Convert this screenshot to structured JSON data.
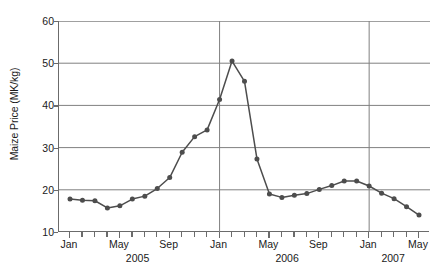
{
  "chart_data": {
    "type": "line",
    "title": "",
    "xlabel": "",
    "ylabel": "Maize Price (MK/kg)",
    "ylim": [
      10,
      60
    ],
    "y_ticks": [
      10,
      20,
      30,
      40,
      50,
      60
    ],
    "grid": true,
    "legend": null,
    "x_month_labels": [
      {
        "label": "Jan",
        "index": 0
      },
      {
        "label": "May",
        "index": 4
      },
      {
        "label": "Sep",
        "index": 8
      },
      {
        "label": "Jan",
        "index": 12
      },
      {
        "label": "May",
        "index": 16
      },
      {
        "label": "Sep",
        "index": 20
      },
      {
        "label": "Jan",
        "index": 24
      },
      {
        "label": "May",
        "index": 28
      }
    ],
    "x_year_labels": [
      {
        "label": "2005",
        "index": 5.5
      },
      {
        "label": "2006",
        "index": 17.5
      },
      {
        "label": "2007",
        "index": 26.0
      }
    ],
    "year_divider_indices": [
      12,
      24
    ],
    "x": [
      "Jan 2005",
      "Feb 2005",
      "Mar 2005",
      "Apr 2005",
      "May 2005",
      "Jun 2005",
      "Jul 2005",
      "Aug 2005",
      "Sep 2005",
      "Oct 2005",
      "Nov 2005",
      "Dec 2005",
      "Jan 2006",
      "Feb 2006",
      "Mar 2006",
      "Apr 2006",
      "May 2006",
      "Jun 2006",
      "Jul 2006",
      "Aug 2006",
      "Sep 2006",
      "Oct 2006",
      "Nov 2006",
      "Dec 2006",
      "Jan 2007",
      "Feb 2007",
      "Mar 2007",
      "Apr 2007",
      "May 2007"
    ],
    "values": [
      17.8,
      17.5,
      17.4,
      15.7,
      16.2,
      17.8,
      18.5,
      20.3,
      22.9,
      28.9,
      32.6,
      34.2,
      41.4,
      50.5,
      45.7,
      27.3,
      19.0,
      18.2,
      18.7,
      19.1,
      20.1,
      21.0,
      22.1,
      22.1,
      20.9,
      19.2,
      17.9,
      16.0,
      14.0
    ],
    "series_color": "#4d4d4d",
    "grid_color": "#808080",
    "axis_color": "#6b6b6b"
  }
}
